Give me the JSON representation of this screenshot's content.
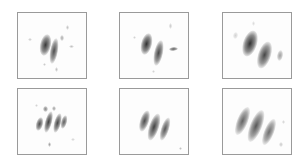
{
  "figure": {
    "layout": {
      "rows": 2,
      "cols": 3
    },
    "panels": [
      {
        "id": "p1",
        "left": 17,
        "top": 12,
        "blobs": [
          {
            "x": 27,
            "y": 32,
            "w": 11,
            "h": 22,
            "rot": 12,
            "shade": "#2e2e2e",
            "alpha": 0.95
          },
          {
            "x": 36,
            "y": 38,
            "w": 8,
            "h": 26,
            "rot": 10,
            "shade": "#3a3a3a",
            "alpha": 0.9
          },
          {
            "x": 44,
            "y": 25,
            "w": 4,
            "h": 6,
            "rot": 0,
            "shade": "#777777",
            "alpha": 0.6
          },
          {
            "x": 49,
            "y": 14,
            "w": 3,
            "h": 5,
            "rot": 0,
            "shade": "#888888",
            "alpha": 0.5
          },
          {
            "x": 53,
            "y": 33,
            "w": 5,
            "h": 3,
            "rot": 0,
            "shade": "#888888",
            "alpha": 0.5
          },
          {
            "x": 12,
            "y": 26,
            "w": 4,
            "h": 3,
            "rot": 0,
            "shade": "#999999",
            "alpha": 0.5
          },
          {
            "x": 26,
            "y": 51,
            "w": 3,
            "h": 3,
            "rot": 0,
            "shade": "#999999",
            "alpha": 0.5
          },
          {
            "x": 38,
            "y": 56,
            "w": 3,
            "h": 5,
            "rot": 0,
            "shade": "#888888",
            "alpha": 0.5
          }
        ]
      },
      {
        "id": "p2",
        "left": 119,
        "top": 12,
        "blobs": [
          {
            "x": 26,
            "y": 31,
            "w": 11,
            "h": 22,
            "rot": 14,
            "shade": "#262626",
            "alpha": 0.95
          },
          {
            "x": 38,
            "y": 40,
            "w": 9,
            "h": 26,
            "rot": 12,
            "shade": "#333333",
            "alpha": 0.9
          },
          {
            "x": 53,
            "y": 36,
            "w": 9,
            "h": 4,
            "rot": -5,
            "shade": "#444444",
            "alpha": 0.85
          },
          {
            "x": 50,
            "y": 13,
            "w": 3,
            "h": 6,
            "rot": 0,
            "shade": "#999999",
            "alpha": 0.5
          },
          {
            "x": 14,
            "y": 24,
            "w": 3,
            "h": 3,
            "rot": 0,
            "shade": "#aaaaaa",
            "alpha": 0.5
          },
          {
            "x": 33,
            "y": 58,
            "w": 3,
            "h": 3,
            "rot": 0,
            "shade": "#aaaaaa",
            "alpha": 0.5
          }
        ]
      },
      {
        "id": "p3",
        "left": 222,
        "top": 12,
        "blobs": [
          {
            "x": 27,
            "y": 30,
            "w": 14,
            "h": 27,
            "rot": 18,
            "shade": "#262626",
            "alpha": 0.95
          },
          {
            "x": 41,
            "y": 42,
            "w": 13,
            "h": 28,
            "rot": 18,
            "shade": "#333333",
            "alpha": 0.9
          },
          {
            "x": 57,
            "y": 42,
            "w": 6,
            "h": 11,
            "rot": 10,
            "shade": "#777777",
            "alpha": 0.7
          },
          {
            "x": 12,
            "y": 22,
            "w": 5,
            "h": 7,
            "rot": 10,
            "shade": "#aaaaaa",
            "alpha": 0.5
          },
          {
            "x": 30,
            "y": 10,
            "w": 3,
            "h": 5,
            "rot": 0,
            "shade": "#aaaaaa",
            "alpha": 0.4
          }
        ]
      },
      {
        "id": "p4",
        "left": 17,
        "top": 88,
        "blobs": [
          {
            "x": 21,
            "y": 35,
            "w": 7,
            "h": 14,
            "rot": 15,
            "shade": "#3a3a3a",
            "alpha": 0.9
          },
          {
            "x": 30,
            "y": 33,
            "w": 7,
            "h": 22,
            "rot": 15,
            "shade": "#2e2e2e",
            "alpha": 0.9
          },
          {
            "x": 39,
            "y": 34,
            "w": 7,
            "h": 20,
            "rot": 15,
            "shade": "#333333",
            "alpha": 0.9
          },
          {
            "x": 46,
            "y": 33,
            "w": 6,
            "h": 14,
            "rot": 15,
            "shade": "#444444",
            "alpha": 0.85
          },
          {
            "x": 27,
            "y": 20,
            "w": 5,
            "h": 6,
            "rot": 0,
            "shade": "#555555",
            "alpha": 0.7
          },
          {
            "x": 36,
            "y": 19,
            "w": 4,
            "h": 5,
            "rot": 0,
            "shade": "#666666",
            "alpha": 0.6
          },
          {
            "x": 31,
            "y": 55,
            "w": 3,
            "h": 5,
            "rot": 0,
            "shade": "#666666",
            "alpha": 0.6
          },
          {
            "x": 18,
            "y": 16,
            "w": 3,
            "h": 3,
            "rot": 0,
            "shade": "#aaaaaa",
            "alpha": 0.5
          },
          {
            "x": 55,
            "y": 50,
            "w": 4,
            "h": 3,
            "rot": 0,
            "shade": "#aaaaaa",
            "alpha": 0.5
          }
        ]
      },
      {
        "id": "p5",
        "left": 119,
        "top": 88,
        "blobs": [
          {
            "x": 24,
            "y": 32,
            "w": 9,
            "h": 22,
            "rot": 18,
            "shade": "#3a3a3a",
            "alpha": 0.9
          },
          {
            "x": 34,
            "y": 38,
            "w": 10,
            "h": 28,
            "rot": 18,
            "shade": "#2e2e2e",
            "alpha": 0.9
          },
          {
            "x": 45,
            "y": 40,
            "w": 8,
            "h": 24,
            "rot": 18,
            "shade": "#3a3a3a",
            "alpha": 0.85
          },
          {
            "x": 60,
            "y": 59,
            "w": 3,
            "h": 3,
            "rot": 0,
            "shade": "#888888",
            "alpha": 0.5
          }
        ]
      },
      {
        "id": "p6",
        "left": 222,
        "top": 88,
        "blobs": [
          {
            "x": 19,
            "y": 32,
            "w": 11,
            "h": 30,
            "rot": 22,
            "shade": "#4a4a4a",
            "alpha": 0.85
          },
          {
            "x": 33,
            "y": 37,
            "w": 12,
            "h": 34,
            "rot": 22,
            "shade": "#3a3a3a",
            "alpha": 0.85
          },
          {
            "x": 46,
            "y": 43,
            "w": 10,
            "h": 28,
            "rot": 22,
            "shade": "#4a4a4a",
            "alpha": 0.8
          },
          {
            "x": 58,
            "y": 55,
            "w": 4,
            "h": 5,
            "rot": 0,
            "shade": "#999999",
            "alpha": 0.5
          },
          {
            "x": 60,
            "y": 33,
            "w": 3,
            "h": 4,
            "rot": 0,
            "shade": "#aaaaaa",
            "alpha": 0.5
          }
        ]
      }
    ]
  }
}
